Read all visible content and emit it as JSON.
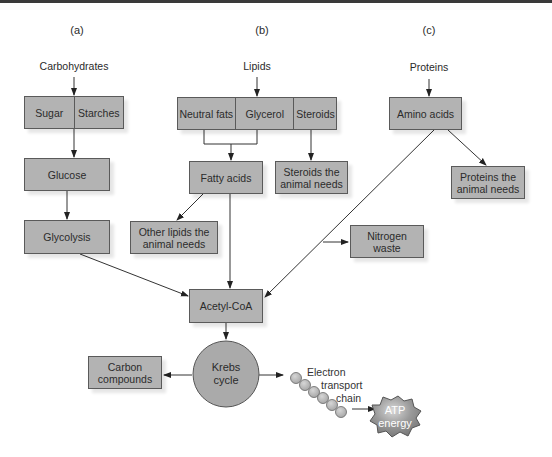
{
  "panels": {
    "a": "(a)",
    "b": "(b)",
    "c": "(c)"
  },
  "sources": {
    "carbohydrates": "Carbohydrates",
    "lipids": "Lipids",
    "proteins": "Proteins"
  },
  "carb_path": {
    "sugar": "Sugar",
    "starches": "Starches",
    "glucose": "Glucose",
    "glycolysis": "Glycolysis"
  },
  "lipid_path": {
    "neutral_fats": "Neutral fats",
    "glycerol": "Glycerol",
    "steroids": "Steroids",
    "fatty_acids": "Fatty acids",
    "steroids_needed": "Steroids the animal needs",
    "other_lipids": "Other lipids the animal needs"
  },
  "protein_path": {
    "amino_acids": "Amino acids",
    "proteins_needed": "Proteins the animal needs",
    "nitrogen_waste": "Nitrogen waste"
  },
  "central": {
    "acetyl_coa": "Acetyl-CoA",
    "krebs": "Krebs cycle",
    "carbon_compounds": "Carbon compounds",
    "etc": "Electron transport chain",
    "etc_line1": "Electron",
    "etc_line2": "transport",
    "etc_line3": "chain",
    "atp_line1": "ATP",
    "atp_line2": "energy"
  },
  "colors": {
    "box_fill": "#b3b3b3",
    "box_border": "#5a5a5a",
    "circle_fill": "#aaaaaa",
    "atp_fill": "#8c8c8c",
    "line": "#333333",
    "top_bar": "#3a3a3a"
  }
}
